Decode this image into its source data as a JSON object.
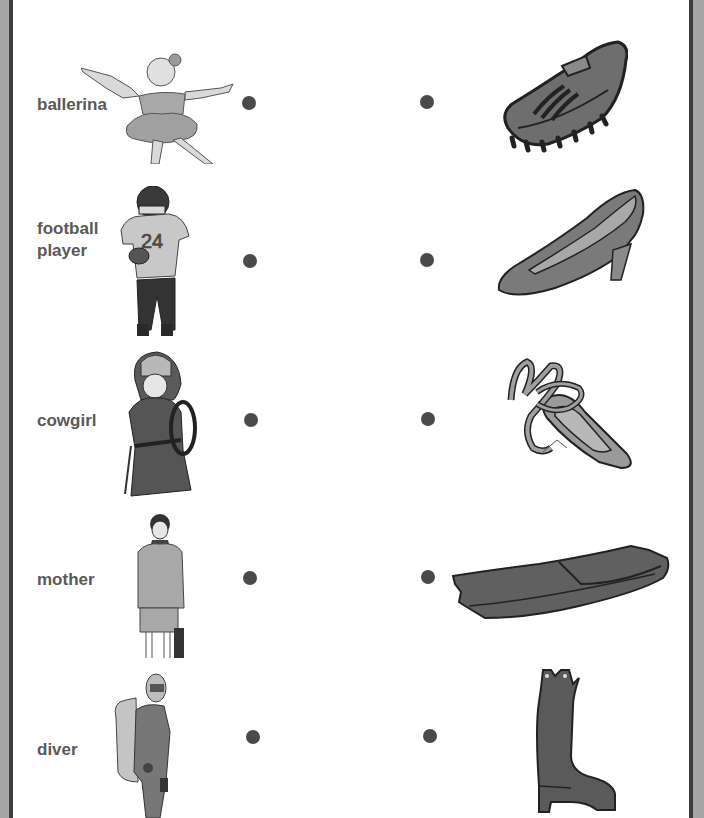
{
  "worksheet": {
    "type": "matching",
    "left_column": [
      {
        "label": "ballerina",
        "picture": "ballerina-icon"
      },
      {
        "label": "football\nplayer",
        "line1": "football",
        "line2": "player",
        "picture": "football-player-icon"
      },
      {
        "label": "cowgirl",
        "picture": "cowgirl-icon"
      },
      {
        "label": "mother",
        "picture": "mother-icon"
      },
      {
        "label": "diver",
        "picture": "diver-icon"
      }
    ],
    "right_column": [
      {
        "picture": "cleat-shoe-icon",
        "description": "football cleat"
      },
      {
        "picture": "high-heel-shoe-icon",
        "description": "high heel pump"
      },
      {
        "picture": "ballet-slipper-icon",
        "description": "ballet slipper"
      },
      {
        "picture": "swim-fin-icon",
        "description": "diving flipper"
      },
      {
        "picture": "cowboy-boot-icon",
        "description": "cowboy boot"
      }
    ],
    "colors": {
      "text": "#595959",
      "dot": "#4a4a4a",
      "border_outer": "#a6a6a6",
      "border_inner": "#3d3d3d",
      "fill_light": "#bdbdbd",
      "fill_mid": "#8a8a8a",
      "fill_dark": "#555555"
    }
  }
}
